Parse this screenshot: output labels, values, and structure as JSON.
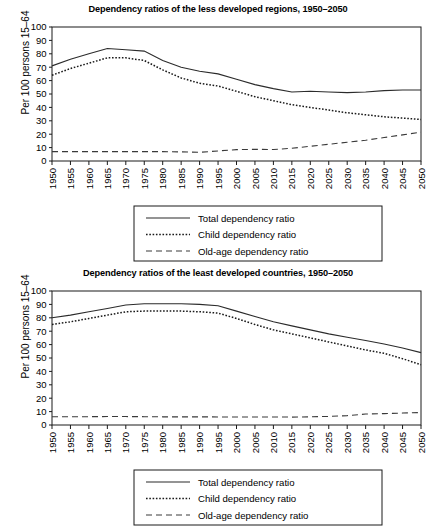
{
  "chart_data": [
    {
      "type": "line",
      "id": "less-developed-regions",
      "title": "Dependency ratios of the less developed regions, 1950–2050",
      "xlabel": "",
      "ylabel": "Per 100 persons 15–64",
      "ylim": [
        0,
        100
      ],
      "ytick_step": 10,
      "yticks": [
        0,
        10,
        20,
        30,
        40,
        50,
        60,
        70,
        80,
        90,
        100
      ],
      "grid": false,
      "legend_position": "below",
      "categories": [
        "1950",
        "1955",
        "1960",
        "1965",
        "1970",
        "1975",
        "1980",
        "1985",
        "1990",
        "1995",
        "2000",
        "2005",
        "2010",
        "2015",
        "2020",
        "2025",
        "2030",
        "2035",
        "2040",
        "2045",
        "2050"
      ],
      "series": [
        {
          "name": "Total dependency ratio",
          "style": "solid",
          "values": [
            71,
            76,
            80,
            84,
            83,
            82,
            75,
            70,
            67,
            65,
            61,
            57,
            54,
            51.5,
            52,
            51.5,
            51,
            51.5,
            52.5,
            53,
            53
          ]
        },
        {
          "name": "Child dependency ratio",
          "style": "dotted",
          "values": [
            64,
            69,
            73,
            77,
            77,
            75,
            68,
            62,
            58,
            56,
            52,
            48,
            45,
            42,
            40,
            38,
            36,
            34.5,
            33,
            32,
            31
          ]
        },
        {
          "name": "Old-age dependency ratio",
          "style": "dashed",
          "values": [
            7,
            7,
            7,
            7,
            7,
            7,
            7,
            6.8,
            6.5,
            7.5,
            8.5,
            8.7,
            8.6,
            9.5,
            11,
            12.5,
            14,
            15.5,
            17.5,
            19.5,
            21.5
          ]
        }
      ]
    },
    {
      "type": "line",
      "id": "least-developed-countries",
      "title": "Dependency ratios of the least developed countries, 1950–2050",
      "xlabel": "",
      "ylabel": "Per 100 persons 15–64",
      "ylim": [
        0,
        100
      ],
      "ytick_step": 10,
      "yticks": [
        0,
        10,
        20,
        30,
        40,
        50,
        60,
        70,
        80,
        90,
        100
      ],
      "grid": false,
      "legend_position": "below",
      "categories": [
        "1950",
        "1955",
        "1960",
        "1965",
        "1970",
        "1975",
        "1980",
        "1985",
        "1990",
        "1995",
        "2000",
        "2005",
        "2010",
        "2015",
        "2020",
        "2025",
        "2030",
        "2035",
        "2040",
        "2045",
        "2050"
      ],
      "series": [
        {
          "name": "Total dependency ratio",
          "style": "solid",
          "values": [
            80,
            82,
            84.5,
            87,
            89.5,
            90.5,
            90.5,
            90.5,
            90,
            89,
            85,
            81,
            77,
            74,
            71,
            68,
            65.5,
            63,
            60.5,
            57.5,
            54
          ]
        },
        {
          "name": "Child dependency ratio",
          "style": "dotted",
          "values": [
            75,
            77,
            79.5,
            82,
            84.5,
            85,
            85,
            85,
            84.5,
            83.5,
            79.5,
            75,
            71,
            68,
            65,
            62,
            59,
            56,
            53.5,
            49.5,
            45
          ]
        },
        {
          "name": "Old-age dependency ratio",
          "style": "dashed",
          "values": [
            6.2,
            6.2,
            6.2,
            6.3,
            6.3,
            6.2,
            6.1,
            6.1,
            6.1,
            6.0,
            6.0,
            6.0,
            6.0,
            5.9,
            6.1,
            6.4,
            7.0,
            8.2,
            8.5,
            8.9,
            9.3
          ]
        }
      ]
    }
  ],
  "figures": [
    {
      "title": "Dependency ratios of the less developed regions, 1950–2050",
      "ylabel": "Per 100 persons 15–64",
      "legend": [
        "Total dependency ratio",
        "Child dependency ratio",
        "Old-age dependency ratio"
      ]
    },
    {
      "title": "Dependency ratios of the least developed countries, 1950–2050",
      "ylabel": "Per 100 persons 15–64",
      "legend": [
        "Total dependency ratio",
        "Child dependency ratio",
        "Old-age dependency ratio"
      ]
    }
  ],
  "colors": {
    "background": "#ffffff",
    "axis": "#1a1a1a",
    "total_series": "#2b2b2b",
    "child_series": "#1a1a1a",
    "oldage_series": "#3a3a3a"
  }
}
